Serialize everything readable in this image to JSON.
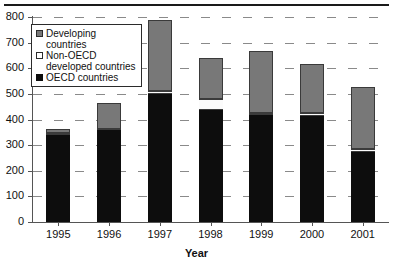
{
  "chart_data": {
    "type": "bar",
    "stacked": true,
    "title": "",
    "xlabel": "Year",
    "ylabel": "",
    "categories": [
      "1995",
      "1996",
      "1997",
      "1998",
      "1999",
      "2000",
      "2001"
    ],
    "ylim": [
      0,
      800
    ],
    "ytick_labels": [
      "0",
      "100",
      "200",
      "300",
      "400",
      "500",
      "600",
      "700",
      "800"
    ],
    "ytick_values": [
      0,
      100,
      200,
      300,
      400,
      500,
      600,
      700,
      800
    ],
    "grid": true,
    "grid_axis": "y",
    "grid_style": "dashed",
    "legend_position": "upper-left-inside",
    "series": [
      {
        "name": "OECD countries",
        "color": "#0d0d0d",
        "values": [
          340,
          358,
          500,
          438,
          418,
          412,
          275
        ]
      },
      {
        "name": "Non-OECD developed countries",
        "color": "#ffffff",
        "values": [
          6,
          6,
          12,
          42,
          9,
          13,
          9
        ]
      },
      {
        "name": "Developing countries",
        "color": "#787878",
        "values": [
          17,
          102,
          278,
          160,
          241,
          191,
          241
        ]
      }
    ],
    "totals": [
      363,
      466,
      790,
      640,
      668,
      616,
      525
    ]
  },
  "legend": {
    "items": [
      {
        "label": "Developing countries",
        "swatch": "gray-square-icon"
      },
      {
        "label": "Non-OECD\ndeveloped countries",
        "swatch": "white-square-icon"
      },
      {
        "label": "OECD countries",
        "swatch": "black-square-icon"
      }
    ]
  }
}
